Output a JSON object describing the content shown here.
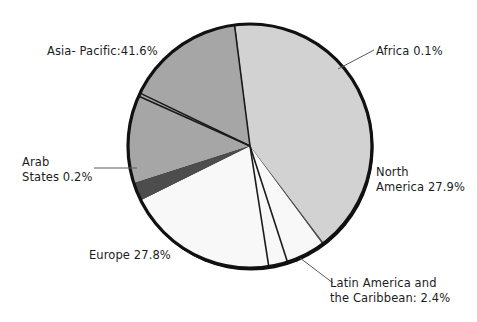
{
  "chart_data": {
    "type": "pie",
    "title": "",
    "subtitle": "",
    "xlabel": "",
    "ylabel": "",
    "legend_position": "none",
    "grid": false,
    "units": "percent",
    "total": 100.0,
    "categories": [
      "Asia- Pacific",
      "Africa",
      "North America",
      "Latin America and the Caribbean",
      "Europe",
      "Arab States"
    ],
    "values": [
      41.6,
      0.1,
      27.9,
      2.4,
      27.8,
      0.2
    ],
    "slices": [
      {
        "name": "asia-pacific",
        "label": "Asia- Pacific:41.6%",
        "category": "Asia- Pacific",
        "value": 41.6,
        "color": "#d2d2d2",
        "start_angle": -7.0,
        "end_angle": 142.8,
        "label_kind": "direct"
      },
      {
        "name": "africa",
        "label": "Africa 0.1%",
        "category": "Africa",
        "value": 0.1,
        "color": "#b4b4b4",
        "start_angle": -7.4,
        "end_angle": -7.0,
        "label_kind": "leader"
      },
      {
        "name": "north-america",
        "label_line1": "North",
        "label_line2": "America 27.9%",
        "category": "North America",
        "value": 27.9,
        "color": "#a6a6a6",
        "start_angle": -107.8,
        "end_angle": -7.4,
        "label_kind": "direct"
      },
      {
        "name": "latin-america-caribbean",
        "label_line1": "Latin America and",
        "label_line2": "the Caribbean: 2.4%",
        "category": "Latin America and the Caribbean",
        "value": 2.4,
        "color": "#4d4d4d",
        "start_angle": -116.4,
        "end_angle": -107.8,
        "label_kind": "leader"
      },
      {
        "name": "europe",
        "label": "Europe 27.8%",
        "category": "Europe",
        "value": 27.8,
        "color": "#f8f8f8",
        "start_angle": 143.5,
        "end_angle": 243.6,
        "label_kind": "direct"
      },
      {
        "name": "arab-states",
        "label_line1": "Arab",
        "label_line2": "States 0.2%",
        "category": "Arab States",
        "value": 0.2,
        "color": "#585858",
        "start_angle": 142.8,
        "end_angle": 143.5,
        "label_kind": "leader"
      }
    ],
    "colors": {
      "asia_pacific": "#d2d2d2",
      "africa": "#b4b4b4",
      "north_america": "#a6a6a6",
      "latin_america": "#4d4d4d",
      "europe": "#f8f8f8",
      "arab_states": "#585858",
      "outline": "#111111",
      "background": "#ffffff",
      "text": "#1c1c1c",
      "leader_line": "#5a5a5a"
    }
  },
  "labels": {
    "asia_pacific": "Asia- Pacific:41.6%",
    "africa": "Africa 0.1%",
    "north_america_line1": "North",
    "north_america_line2": "America 27.9%",
    "arab_states_line1": "Arab",
    "arab_states_line2": "States 0.2%",
    "europe": "Europe 27.8%",
    "latin_america_line1": "Latin America and",
    "latin_america_line2": "the Caribbean: 2.4%"
  }
}
